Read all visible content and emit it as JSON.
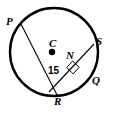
{
  "figure": {
    "stroke_color": "#000000",
    "fill_color": "#ffffff",
    "background": "#ffffff",
    "circle": {
      "center_label": "C",
      "cx": 54,
      "cy": 52,
      "r": 44,
      "stroke_width": 2.2
    },
    "center_dot": {
      "cx": 52,
      "cy": 52,
      "r": 3.2
    },
    "points": [
      {
        "key": "P",
        "label": "P",
        "x": 21,
        "y": 24
      },
      {
        "key": "C",
        "label": "C",
        "x": 52,
        "y": 52
      },
      {
        "key": "S",
        "label": "S",
        "x": 94,
        "y": 44
      },
      {
        "key": "N",
        "label": "N",
        "x": 72,
        "y": 62
      },
      {
        "key": "Q",
        "label": "Q",
        "x": 90,
        "y": 82
      },
      {
        "key": "R",
        "label": "R",
        "x": 57,
        "y": 95
      }
    ],
    "segments": [
      {
        "key": "PR",
        "label": "PR",
        "from": "P",
        "to": "R",
        "kind": "diameter"
      },
      {
        "key": "SQ",
        "label": "SQ",
        "from": "S",
        "to": "Q",
        "kind": "chord"
      }
    ],
    "measure": {
      "label": "15",
      "of_segment": "NR"
    },
    "right_angle": {
      "at": "N",
      "marker": "right-angle-square",
      "size": 9
    }
  }
}
